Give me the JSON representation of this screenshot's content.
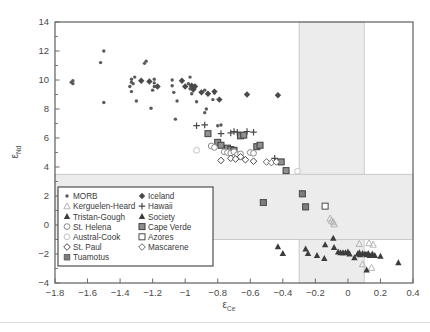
{
  "figure": {
    "background_color": "#ffffff",
    "frame_color": "#6b6b6b",
    "band_color": "#ececec",
    "band_line_color": "#b9b9b9"
  },
  "axes": {
    "x_title_symbol": "ε",
    "x_title_sub": "Ce",
    "y_title_symbol": "ε",
    "y_title_sub": "Nd",
    "x_ticks": [
      "−1.8",
      "−1.6",
      "−1.4",
      "−1.2",
      "−1",
      "−0.8",
      "−0.6",
      "−0.4",
      "−0.2",
      "0",
      "0.2",
      "0.4"
    ],
    "y_ticks": [
      "14",
      "12",
      "10",
      "8",
      "6",
      "4",
      "2",
      "0",
      "−2",
      "−4"
    ]
  },
  "legend": {
    "left_column": [
      {
        "label": "MORB",
        "marker": "dot",
        "color": "#5a5a5a"
      },
      {
        "label": "Kerguelen-Heard",
        "marker": "triangle-open",
        "color": "#b5b5b5"
      },
      {
        "label": "Tristan-Gough",
        "marker": "triangle-filled",
        "color": "#3c3c3c"
      },
      {
        "label": "St. Helena",
        "marker": "circle-open",
        "color": "#8a8a8a"
      },
      {
        "label": "Austral-Cook",
        "marker": "circle-open-light",
        "color": "#c2c2c2"
      },
      {
        "label": "St. Paul",
        "marker": "diamond-open",
        "color": "#4a4a4a"
      },
      {
        "label": "Tuamotus",
        "marker": "square-filled",
        "color": "#7d7d7d"
      }
    ],
    "right_column": [
      {
        "label": "Iceland",
        "marker": "diamond-filled",
        "color": "#4a4a4a"
      },
      {
        "label": "Hawaii",
        "marker": "plus",
        "color": "#4a4a4a"
      },
      {
        "label": "Society",
        "marker": "triangle-filled",
        "color": "#3c3c3c"
      },
      {
        "label": "Cape Verde",
        "marker": "square-filled-border",
        "color": "#8f8f8f"
      },
      {
        "label": "Azores",
        "marker": "square-open",
        "color": "#4a4a4a"
      },
      {
        "label": "Mascarene",
        "marker": "diamond-open",
        "color": "#6a6a6a"
      }
    ]
  },
  "chart_data": {
    "type": "scatter",
    "title": "",
    "xlabel": "εCe",
    "ylabel": "εNd",
    "xlim": [
      -1.8,
      0.4
    ],
    "ylim": [
      -4,
      14
    ],
    "grid": false,
    "legend_position": "lower-left-inside",
    "shaded_regions": [
      {
        "name": "vertical-band",
        "orientation": "vertical",
        "x_range": [
          -0.3,
          0.1
        ],
        "y_range": [
          -4,
          14
        ]
      },
      {
        "name": "horizontal-band",
        "orientation": "horizontal",
        "x_range": [
          -1.8,
          0.4
        ],
        "y_range": [
          -1.0,
          3.5
        ]
      }
    ],
    "series": [
      {
        "name": "MORB",
        "marker": "dot",
        "color": "#5a5a5a",
        "points": [
          [
            -1.69,
            9.95
          ],
          [
            -1.69,
            9.75
          ],
          [
            -1.7,
            9.85
          ],
          [
            -1.5,
            12.0
          ],
          [
            -1.52,
            11.2
          ],
          [
            -1.5,
            8.45
          ],
          [
            -1.33,
            10.05
          ],
          [
            -1.33,
            9.85
          ],
          [
            -1.34,
            9.55
          ],
          [
            -1.33,
            9.2
          ],
          [
            -1.32,
            9.75
          ],
          [
            -1.3,
            8.55
          ],
          [
            -1.31,
            10.2
          ],
          [
            -1.24,
            11.3
          ],
          [
            -1.25,
            11.15
          ],
          [
            -1.19,
            10.05
          ],
          [
            -1.19,
            9.8
          ],
          [
            -1.19,
            9.55
          ],
          [
            -1.2,
            9.3
          ],
          [
            -1.21,
            8.05
          ],
          [
            -1.08,
            10.0
          ],
          [
            -1.08,
            9.6
          ],
          [
            -1.07,
            9.15
          ],
          [
            -1.05,
            8.55
          ],
          [
            -1.06,
            7.3
          ],
          [
            -0.97,
            10.2
          ],
          [
            -0.98,
            9.75
          ],
          [
            -0.97,
            9.4
          ],
          [
            -0.96,
            9.05
          ],
          [
            -0.93,
            8.5
          ],
          [
            -0.94,
            9.6
          ],
          [
            -0.88,
            9.3
          ],
          [
            -0.87,
            8.0
          ],
          [
            -0.88,
            7.75
          ],
          [
            -0.82,
            9.1
          ],
          [
            -0.83,
            8.65
          ],
          [
            -0.8,
            6.85
          ],
          [
            -0.78,
            6.9
          ]
        ]
      },
      {
        "name": "Iceland",
        "marker": "diamond-filled",
        "color": "#4a4a4a",
        "points": [
          [
            -1.27,
            9.95
          ],
          [
            -1.22,
            9.9
          ],
          [
            -1.17,
            9.55
          ],
          [
            -1.02,
            9.95
          ],
          [
            -1.0,
            9.55
          ],
          [
            -0.96,
            9.6
          ],
          [
            -0.95,
            9.45
          ],
          [
            -0.94,
            9.55
          ],
          [
            -0.95,
            9.35
          ],
          [
            -0.9,
            9.15
          ],
          [
            -0.86,
            9.05
          ],
          [
            -0.82,
            9.2
          ],
          [
            -0.79,
            8.65
          ],
          [
            -0.62,
            9.0
          ],
          [
            -0.43,
            8.95
          ]
        ]
      },
      {
        "name": "Hawaii",
        "marker": "plus",
        "color": "#4a4a4a",
        "points": [
          [
            -0.93,
            6.85
          ],
          [
            -0.88,
            6.9
          ],
          [
            -0.78,
            6.3
          ],
          [
            -0.72,
            6.35
          ],
          [
            -0.7,
            6.45
          ],
          [
            -0.68,
            6.4
          ],
          [
            -0.62,
            6.45
          ],
          [
            -0.58,
            6.4
          ],
          [
            -0.45,
            4.6
          ]
        ]
      },
      {
        "name": "Cape Verde",
        "marker": "square-filled-border",
        "color": "#8f8f8f",
        "points": [
          [
            -0.86,
            6.3
          ],
          [
            -0.8,
            5.7
          ],
          [
            -0.78,
            5.5
          ],
          [
            -0.74,
            5.3
          ],
          [
            -0.72,
            5.2
          ],
          [
            -0.7,
            5.15
          ],
          [
            -0.66,
            6.15
          ],
          [
            -0.64,
            6.2
          ],
          [
            -0.56,
            5.4
          ],
          [
            -0.54,
            5.5
          ],
          [
            -0.41,
            4.35
          ],
          [
            -0.38,
            3.75
          ],
          [
            -0.28,
            2.15
          ],
          [
            -0.26,
            1.25
          ],
          [
            -0.52,
            1.55
          ]
        ]
      },
      {
        "name": "St. Helena",
        "marker": "circle-open",
        "color": "#8a8a8a",
        "points": [
          [
            -0.84,
            5.45
          ],
          [
            -0.82,
            5.35
          ],
          [
            -0.76,
            5.05
          ],
          [
            -0.74,
            5.0
          ],
          [
            -0.72,
            4.95
          ],
          [
            -0.7,
            5.05
          ],
          [
            -0.68,
            4.85
          ],
          [
            -0.66,
            4.9
          ],
          [
            -0.6,
            5.0
          ],
          [
            -0.58,
            4.95
          ]
        ]
      },
      {
        "name": "Austral-Cook",
        "marker": "circle-open-light",
        "color": "#c2c2c2",
        "points": [
          [
            -0.93,
            5.15
          ],
          [
            -0.31,
            3.7
          ]
        ]
      },
      {
        "name": "St. Paul",
        "marker": "diamond-open",
        "color": "#4a4a4a",
        "points": [
          [
            -0.78,
            4.45
          ],
          [
            -0.72,
            4.6
          ],
          [
            -0.69,
            4.55
          ],
          [
            -0.66,
            4.7
          ],
          [
            -0.63,
            4.5
          ],
          [
            -0.58,
            4.4
          ]
        ]
      },
      {
        "name": "Mascarene",
        "marker": "diamond-open",
        "color": "#6a6a6a",
        "points": [
          [
            -0.5,
            4.35
          ],
          [
            -0.47,
            4.3
          ],
          [
            -0.44,
            4.35
          ]
        ]
      },
      {
        "name": "Azores",
        "marker": "square-open",
        "color": "#4a4a4a",
        "points": [
          [
            -0.14,
            1.3
          ]
        ]
      },
      {
        "name": "Tuamotus",
        "marker": "square-filled",
        "color": "#7d7d7d",
        "points": [
          [
            -0.28,
            2.15
          ],
          [
            -0.26,
            1.25
          ],
          [
            -0.52,
            1.55
          ]
        ]
      },
      {
        "name": "Kerguelen-Heard",
        "marker": "triangle-open",
        "color": "#b5b5b5",
        "points": [
          [
            -0.11,
            0.45
          ],
          [
            -0.1,
            0.3
          ],
          [
            -0.09,
            0.2
          ],
          [
            -0.085,
            0.05
          ],
          [
            0.07,
            -1.3
          ],
          [
            0.13,
            -1.25
          ],
          [
            0.155,
            -1.35
          ],
          [
            0.09,
            -2.7
          ],
          [
            0.145,
            -2.95
          ]
        ]
      },
      {
        "name": "Society",
        "marker": "triangle-filled",
        "color": "#3c3c3c",
        "points": [
          [
            -0.43,
            -1.5
          ],
          [
            -0.4,
            -1.95
          ],
          [
            -0.26,
            -1.65
          ],
          [
            -0.245,
            -1.95
          ],
          [
            -0.19,
            -2.1
          ],
          [
            -0.14,
            -1.35
          ],
          [
            -0.145,
            -2.3
          ],
          [
            -0.09,
            -0.9
          ],
          [
            -0.085,
            -1.55
          ],
          [
            -0.06,
            -1.85
          ],
          [
            -0.045,
            -1.9
          ],
          [
            -0.03,
            -1.9
          ],
          [
            -0.015,
            -1.9
          ],
          [
            0.0,
            -1.85
          ],
          [
            0.01,
            -2.0
          ],
          [
            0.04,
            -2.25
          ],
          [
            0.06,
            -2.0
          ],
          [
            0.07,
            -1.9
          ],
          [
            0.075,
            -2.05
          ],
          [
            0.09,
            -1.95
          ],
          [
            0.105,
            -2.0
          ],
          [
            0.115,
            -2.05
          ],
          [
            0.125,
            -1.95
          ],
          [
            0.135,
            -2.1
          ],
          [
            0.15,
            -2.0
          ],
          [
            0.165,
            -2.1
          ],
          [
            0.2,
            -2.15
          ],
          [
            0.115,
            -3.1
          ],
          [
            0.31,
            -2.6
          ]
        ]
      }
    ]
  }
}
